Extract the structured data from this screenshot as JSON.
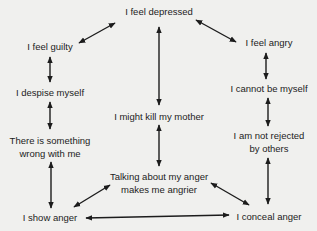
{
  "diagram": {
    "colors": {
      "background": "#f0f0ee",
      "text": "#1c1c1c",
      "arrow": "#1c1c1c"
    },
    "nodes": [
      {
        "id": "depressed",
        "label": "I feel depressed",
        "x": 159,
        "y": 6
      },
      {
        "id": "guilty",
        "label": "I feel guilty",
        "x": 50,
        "y": 41
      },
      {
        "id": "angry",
        "label": "I feel angry",
        "x": 269,
        "y": 37
      },
      {
        "id": "cannot_be_myself",
        "label": "I cannot be myself",
        "x": 269,
        "y": 83
      },
      {
        "id": "despise",
        "label": "I despise myself",
        "x": 50,
        "y": 87
      },
      {
        "id": "kill_mother",
        "label": "I might kill my mother",
        "x": 159,
        "y": 111
      },
      {
        "id": "something_wrong_1",
        "label": "There is something",
        "x": 50,
        "y": 135
      },
      {
        "id": "something_wrong_2",
        "label": "wrong with me",
        "x": 50,
        "y": 148
      },
      {
        "id": "not_rejected_1",
        "label": "I am not rejected",
        "x": 269,
        "y": 130
      },
      {
        "id": "not_rejected_2",
        "label": "by others",
        "x": 269,
        "y": 143
      },
      {
        "id": "talking_1",
        "label": "Talking about my anger",
        "x": 159,
        "y": 171
      },
      {
        "id": "talking_2",
        "label": "makes me angrier",
        "x": 159,
        "y": 184
      },
      {
        "id": "show_anger",
        "label": "I show anger",
        "x": 50,
        "y": 212
      },
      {
        "id": "conceal_anger",
        "label": "I conceal anger",
        "x": 269,
        "y": 211
      }
    ],
    "edges": [
      {
        "from": "depressed",
        "to": "guilty",
        "x1": 115,
        "y1": 23,
        "x2": 79,
        "y2": 43,
        "type": "double-arrow"
      },
      {
        "from": "depressed",
        "to": "angry",
        "x1": 196,
        "y1": 20,
        "x2": 236,
        "y2": 42,
        "type": "double-arrow"
      },
      {
        "from": "depressed",
        "to": "kill_mother",
        "x1": 159,
        "y1": 27,
        "x2": 159,
        "y2": 105,
        "type": "double-arrow"
      },
      {
        "from": "guilty",
        "to": "despise",
        "x1": 50,
        "y1": 57,
        "x2": 50,
        "y2": 82,
        "type": "double-arrow"
      },
      {
        "from": "angry",
        "to": "cannot_be_myself",
        "x1": 266,
        "y1": 53,
        "x2": 266,
        "y2": 79,
        "type": "double-arrow"
      },
      {
        "from": "despise",
        "to": "something_wrong",
        "x1": 50,
        "y1": 102,
        "x2": 50,
        "y2": 129,
        "type": "double-arrow"
      },
      {
        "from": "cannot_be_myself",
        "to": "not_rejected",
        "x1": 268,
        "y1": 98,
        "x2": 268,
        "y2": 126,
        "type": "double-arrow"
      },
      {
        "from": "kill_mother",
        "to": "talking",
        "x1": 159,
        "y1": 125,
        "x2": 159,
        "y2": 166,
        "type": "double-arrow"
      },
      {
        "from": "something_wrong",
        "to": "show_anger",
        "x1": 51,
        "y1": 162,
        "x2": 51,
        "y2": 208,
        "type": "double-arrow"
      },
      {
        "from": "not_rejected",
        "to": "conceal_anger",
        "x1": 268,
        "y1": 158,
        "x2": 268,
        "y2": 204,
        "type": "double-arrow"
      },
      {
        "from": "talking",
        "to": "show_anger",
        "x1": 110,
        "y1": 185,
        "x2": 74,
        "y2": 207,
        "type": "double-arrow"
      },
      {
        "from": "talking",
        "to": "conceal_anger",
        "x1": 211,
        "y1": 183,
        "x2": 249,
        "y2": 205,
        "type": "double-arrow"
      },
      {
        "from": "show_anger",
        "to": "conceal_anger",
        "x1": 86,
        "y1": 218,
        "x2": 229,
        "y2": 215,
        "type": "double-arrow"
      }
    ]
  }
}
